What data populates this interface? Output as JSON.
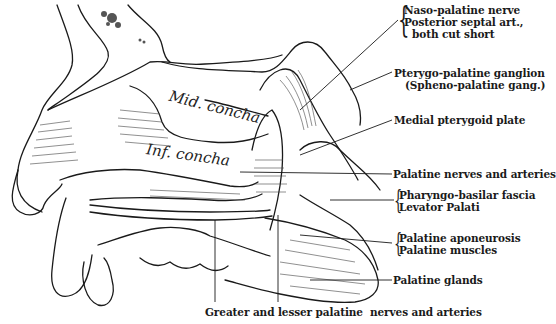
{
  "figure": {
    "internal_labels": {
      "mid_concha": "Mid. concha",
      "inf_concha": "Inf. concha"
    },
    "callouts": [
      {
        "id": "naso-palatine",
        "lines": [
          "Naso-palatine nerve",
          "Posterior septal art.,",
          "  both cut short"
        ]
      },
      {
        "id": "pterygo-palatine",
        "lines": [
          "Pterygo-palatine ganglion",
          "(Spheno-palatine gang.)"
        ]
      },
      {
        "id": "medial-pterygoid",
        "lines": [
          "Medial pterygoid plate"
        ]
      },
      {
        "id": "palatine-nerves",
        "lines": [
          "Palatine nerves and arteries"
        ]
      },
      {
        "id": "pharyngo-basilar",
        "lines": [
          "Pharyngo-basilar fascia",
          "Levator Palati"
        ]
      },
      {
        "id": "palatine-aponeurosis",
        "lines": [
          "Palatine aponeurosis",
          "Palatine muscles"
        ]
      },
      {
        "id": "palatine-glands",
        "lines": [
          "Palatine glands"
        ]
      }
    ],
    "bottom_caption": "Greater and lesser palatine  nerves and arteries"
  }
}
